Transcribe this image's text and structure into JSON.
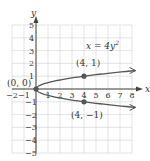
{
  "chart_data": {
    "type": "line",
    "title": "",
    "equation": "x = 4y²",
    "equation_parts": {
      "lhs": "x = 4y",
      "exp": "2"
    },
    "xlabel": "x",
    "ylabel": "y",
    "xlim": [
      -2,
      8
    ],
    "ylim": [
      -5,
      5
    ],
    "grid": true,
    "x_ticks": [
      "-2",
      "-1",
      "1",
      "2",
      "3",
      "4",
      "5",
      "6",
      "7",
      "8"
    ],
    "y_ticks": [
      "-5",
      "-4",
      "-3",
      "-2",
      "-1",
      "1",
      "2",
      "3",
      "4",
      "5"
    ],
    "series": [
      {
        "name": "x = 4y^2 (upper branch)",
        "points": [
          [
            0,
            0
          ],
          [
            1,
            0.5
          ],
          [
            4,
            1
          ],
          [
            8,
            1.414
          ]
        ]
      },
      {
        "name": "x = 4y^2 (lower branch)",
        "points": [
          [
            0,
            0
          ],
          [
            1,
            -0.5
          ],
          [
            4,
            -1
          ],
          [
            8,
            -1.414
          ]
        ]
      }
    ],
    "highlighted_points": [
      {
        "label": "(0, 0)",
        "x": 0,
        "y": 0
      },
      {
        "label": "(4, 1)",
        "x": 4,
        "y": 1
      },
      {
        "label": "(4, −1)",
        "x": 4,
        "y": -1
      }
    ],
    "colors": {
      "curve": "#555555",
      "grid": "#d0d0d0",
      "axis": "#444444",
      "point": "#555555"
    }
  }
}
